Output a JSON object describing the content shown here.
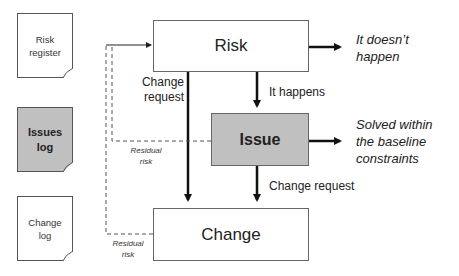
{
  "documents": [
    {
      "id": "risk-register",
      "label_line1": "Risk",
      "label_line2": "register",
      "fill": "#ffffff"
    },
    {
      "id": "issues-log",
      "label_line1": "Issues",
      "label_line2": "log",
      "fill": "#c0c0c0"
    },
    {
      "id": "change-log",
      "label_line1": "Change",
      "label_line2": "log",
      "fill": "#ffffff"
    }
  ],
  "boxes": {
    "risk": "Risk",
    "issue": "Issue",
    "change": "Change"
  },
  "labels": {
    "change_request_left_line1": "Change",
    "change_request_left_line2": "request",
    "it_happens": "It happens",
    "change_request_right": "Change request",
    "residual_risk_1_line1": "Residual",
    "residual_risk_1_line2": "risk",
    "residual_risk_2_line1": "Residual",
    "residual_risk_2_line2": "risk"
  },
  "outcomes": {
    "risk_outcome_line1": "It doesn’t",
    "risk_outcome_line2": "happen",
    "issue_outcome_line1": "Solved within",
    "issue_outcome_line2": "the baseline",
    "issue_outcome_line3": "constraints"
  },
  "colors": {
    "grey_fill": "#c0c0c0",
    "line": "#111111",
    "dashed": "#555555"
  }
}
